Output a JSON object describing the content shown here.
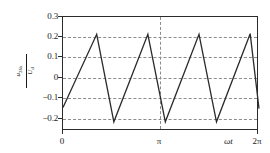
{
  "chart_data": {
    "type": "line",
    "title": "",
    "xlabel": "ωt",
    "ylabel": "u2δk / Ud",
    "ylabel_numerator": "u",
    "ylabel_numerator_sub": "2δk",
    "ylabel_denominator": "U",
    "ylabel_denominator_sub": "d",
    "xlim": [
      0,
      6.283185
    ],
    "ylim": [
      -0.26,
      0.3
    ],
    "grid": true,
    "grid_axis": "both",
    "legend": "none",
    "yticks": [
      0.3,
      0.2,
      0.1,
      0,
      -0.1,
      -0.2
    ],
    "ytick_labels": [
      "0.3",
      "0.2",
      "0.1",
      "0",
      "−0.1",
      "−0.2"
    ],
    "xticks": [
      0,
      3.141593,
      6.283185
    ],
    "xtick_labels": [
      "0",
      "π",
      "2π"
    ],
    "series": [
      {
        "name": "u2δk/Ud",
        "x": [
          0.0,
          1.08,
          1.63,
          2.72,
          3.28,
          4.36,
          4.92,
          6.0,
          6.283185
        ],
        "y": [
          -0.145,
          0.215,
          -0.215,
          0.215,
          -0.215,
          0.215,
          -0.215,
          0.218,
          -0.15
        ],
        "color": "#2b2b2b",
        "style": "solid",
        "width": 1.3
      }
    ],
    "annotations": [
      {
        "text": "π",
        "type": "vertical-dashed-gridline",
        "x": 3.141593
      }
    ]
  }
}
